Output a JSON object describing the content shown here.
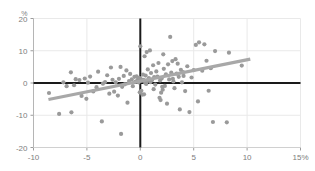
{
  "chart_data": {
    "type": "scatter",
    "title": "",
    "subtitle": "",
    "xlabel": "",
    "ylabel": "",
    "y_unit_label": "%",
    "x_unit_suffix": "%",
    "xlim": [
      -10,
      15
    ],
    "ylim": [
      -20,
      20
    ],
    "xticks": [
      -10,
      -5,
      0,
      5,
      10,
      15
    ],
    "xtick_labels": [
      "-10",
      "-5",
      "0",
      "5",
      "10",
      "15%"
    ],
    "yticks": [
      -20,
      -10,
      0,
      10,
      20
    ],
    "ytick_labels": [
      "-20",
      "-10",
      "0",
      "10",
      "20"
    ],
    "grid": true,
    "grid_color": "#e9e9e9",
    "legend": "none",
    "origin_lines": {
      "x": 0,
      "y": 0,
      "color": "#1a1a1a"
    },
    "marker_color": "#9a9a9a",
    "marker_size": 2.1,
    "trendline": {
      "type": "linear",
      "color": "#a8a8a8",
      "width": 3.2,
      "x_start": -8.6,
      "y_start": -5.1,
      "x_end": 10.3,
      "y_end": 7.4,
      "slope": 0.661,
      "intercept": 0.585
    },
    "points": [
      [
        -8.55,
        -3.1
      ],
      [
        -7.6,
        -9.6
      ],
      [
        -6.9,
        -1.0
      ],
      [
        -6.5,
        3.3
      ],
      [
        -6.45,
        -9.1
      ],
      [
        -6.2,
        -0.7
      ],
      [
        -5.7,
        0.9
      ],
      [
        -5.5,
        -4.0
      ],
      [
        -5.2,
        1.4
      ],
      [
        -5.05,
        -4.9
      ],
      [
        -4.7,
        2.0
      ],
      [
        -4.4,
        -2.6
      ],
      [
        -4.1,
        -1.3
      ],
      [
        -3.95,
        3.5
      ],
      [
        -3.6,
        -11.9
      ],
      [
        -3.5,
        -0.2
      ],
      [
        -3.3,
        0.3
      ],
      [
        -3.1,
        2.4
      ],
      [
        -2.9,
        -3.3
      ],
      [
        -2.75,
        4.8
      ],
      [
        -2.6,
        1.0
      ],
      [
        -2.45,
        -2.7
      ],
      [
        -2.3,
        0.2
      ],
      [
        -2.1,
        -3.9
      ],
      [
        -2.0,
        1.3
      ],
      [
        -1.85,
        5.0
      ],
      [
        -1.8,
        -15.8
      ],
      [
        -1.7,
        -1.2
      ],
      [
        -1.55,
        2.2
      ],
      [
        -1.45,
        -0.4
      ],
      [
        -1.3,
        3.9
      ],
      [
        -1.2,
        -6.1
      ],
      [
        -1.05,
        0.6
      ],
      [
        -0.95,
        2.8
      ],
      [
        -0.8,
        1.1
      ],
      [
        -0.7,
        -1.0
      ],
      [
        -0.55,
        1.9
      ],
      [
        -0.45,
        0.4
      ],
      [
        -0.35,
        2.1
      ],
      [
        -0.25,
        1.0
      ],
      [
        -0.15,
        0.2
      ],
      [
        -0.1,
        1.6
      ],
      [
        0.0,
        11.4
      ],
      [
        0.05,
        1.2
      ],
      [
        0.1,
        -2.4
      ],
      [
        0.15,
        0.7
      ],
      [
        0.2,
        -3.6
      ],
      [
        0.25,
        2.6
      ],
      [
        0.3,
        1.0
      ],
      [
        0.35,
        -3.5
      ],
      [
        0.4,
        8.3
      ],
      [
        0.45,
        0.1
      ],
      [
        0.5,
        2.3
      ],
      [
        0.6,
        9.6
      ],
      [
        0.65,
        0.6
      ],
      [
        0.7,
        4.2
      ],
      [
        0.8,
        1.5
      ],
      [
        0.9,
        10.1
      ],
      [
        0.95,
        0.3
      ],
      [
        1.0,
        3.1
      ],
      [
        1.1,
        0.9
      ],
      [
        1.2,
        5.5
      ],
      [
        1.3,
        1.8
      ],
      [
        1.4,
        -0.5
      ],
      [
        1.5,
        3.6
      ],
      [
        1.6,
        2.0
      ],
      [
        1.7,
        6.2
      ],
      [
        1.8,
        -4.6
      ],
      [
        1.85,
        0.8
      ],
      [
        1.9,
        -5.3
      ],
      [
        1.95,
        -3.0
      ],
      [
        2.0,
        1.4
      ],
      [
        2.1,
        -2.1
      ],
      [
        2.15,
        8.9
      ],
      [
        2.2,
        4.4
      ],
      [
        2.3,
        -0.9
      ],
      [
        2.4,
        2.7
      ],
      [
        2.5,
        -6.4
      ],
      [
        2.6,
        5.8
      ],
      [
        2.7,
        1.1
      ],
      [
        2.8,
        14.3
      ],
      [
        2.9,
        3.2
      ],
      [
        3.0,
        6.8
      ],
      [
        3.1,
        0.5
      ],
      [
        3.2,
        -1.6
      ],
      [
        3.3,
        7.4
      ],
      [
        3.4,
        2.9
      ],
      [
        3.5,
        6.0
      ],
      [
        3.6,
        1.9
      ],
      [
        3.7,
        -8.2
      ],
      [
        3.8,
        4.1
      ],
      [
        3.9,
        0.2
      ],
      [
        4.0,
        3.4
      ],
      [
        4.2,
        -2.5
      ],
      [
        4.4,
        5.2
      ],
      [
        4.6,
        -9.0
      ],
      [
        4.8,
        1.7
      ],
      [
        5.0,
        4.0
      ],
      [
        5.2,
        11.8
      ],
      [
        5.4,
        -5.7
      ],
      [
        5.5,
        12.6
      ],
      [
        5.8,
        3.8
      ],
      [
        6.0,
        12.0
      ],
      [
        6.2,
        6.9
      ],
      [
        6.4,
        -2.4
      ],
      [
        6.6,
        4.6
      ],
      [
        6.8,
        -12.1
      ],
      [
        7.0,
        9.9
      ],
      [
        8.1,
        -12.2
      ],
      [
        8.3,
        9.4
      ],
      [
        9.5,
        5.4
      ],
      [
        -7.2,
        0.2
      ],
      [
        -0.05,
        -2.9
      ],
      [
        1.25,
        -1.9
      ],
      [
        2.05,
        -1.2
      ],
      [
        0.55,
        -0.3
      ],
      [
        3.05,
        1.3
      ],
      [
        4.05,
        2.2
      ],
      [
        -4.9,
        0.1
      ],
      [
        -6.05,
        1.2
      ]
    ]
  }
}
